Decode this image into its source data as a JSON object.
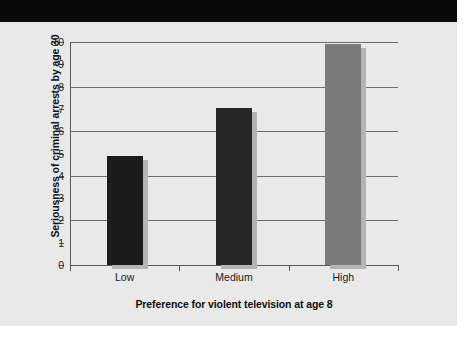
{
  "page": {
    "banner_color": "#0a0a0a",
    "panel_color": "#e9e9e9"
  },
  "chart_data": {
    "type": "bar",
    "title": "",
    "categories": [
      "Low",
      "Medium",
      "High"
    ],
    "values": [
      4.9,
      7.05,
      9.9
    ],
    "xlabel": "Preference for violent television at age 8",
    "ylabel": "Seriousness of criminal arrests by age 30",
    "ylim": [
      0,
      10
    ],
    "ytick_labels": [
      "0",
      "1",
      "2",
      "3",
      "4",
      "5",
      "6",
      "7",
      "8",
      "9",
      "10"
    ],
    "ytick_values": [
      0,
      1,
      2,
      3,
      4,
      5,
      6,
      7,
      8,
      9,
      10
    ],
    "gridline_values": [
      2,
      4,
      6,
      8,
      10
    ],
    "grid": true,
    "legend": "none",
    "bar_colors": [
      "#1c1c1c",
      "#262626",
      "#7b7b7b"
    ],
    "shadow_color": "#b4b4b4"
  }
}
